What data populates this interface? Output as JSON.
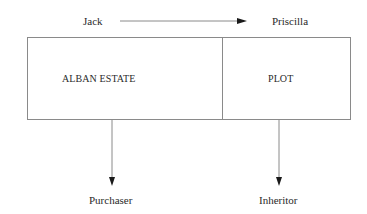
{
  "diagram": {
    "top": {
      "from_label": "Jack",
      "to_label": "Priscilla",
      "arrow_direction": "right"
    },
    "box": {
      "left_section_label": "ALBAN ESTATE",
      "right_section_label": "PLOT"
    },
    "bottom": {
      "left_label": "Purchaser",
      "right_label": "Inheritor",
      "arrow_direction": "down"
    },
    "colors": {
      "line": "#8a8a8a",
      "arrowhead": "#1a1a1a",
      "text": "#2a2a2a",
      "background": "#ffffff"
    }
  }
}
